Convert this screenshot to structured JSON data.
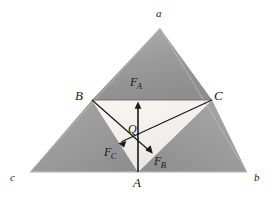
{
  "figure": {
    "background_color": "#ffffff",
    "line_color": "#1a1a1a",
    "corner_fill": "#9c9c9c",
    "center_fill": "#f2f1ee",
    "outer_edge_color": "#b4b4b4"
  },
  "labels": {
    "outer_vertex_top": "a",
    "outer_vertex_left": "c",
    "outer_vertex_right": "b",
    "inner_vertex_left": "B",
    "inner_vertex_right": "C",
    "inner_vertex_bottom": "A",
    "center_point": "Q",
    "force_a_main": "F",
    "force_a_sub": "A",
    "force_b_main": "F",
    "force_b_sub": "B",
    "force_c_main": "F",
    "force_c_sub": "C"
  },
  "geometry": {
    "outer_triangle": {
      "top": [
        160,
        28
      ],
      "left": [
        30,
        172
      ],
      "right": [
        247,
        172
      ]
    },
    "midpoints": {
      "B": [
        92,
        100
      ],
      "C": [
        212,
        100
      ],
      "A": [
        138,
        172
      ]
    },
    "center_point_Q": [
      138,
      134
    ],
    "vectors": [
      {
        "name": "F_A",
        "from": [
          138,
          172
        ],
        "to": [
          138,
          103
        ],
        "direction": "up",
        "label_position": [
          131,
          80
        ]
      },
      {
        "name": "F_C",
        "from": [
          212,
          100
        ],
        "to": [
          119,
          143
        ],
        "direction": "down-left",
        "label_position": [
          108,
          148
        ]
      },
      {
        "name": "F_B",
        "from": [
          92,
          100
        ],
        "to": [
          152,
          153
        ],
        "direction": "down-right",
        "label_position": [
          155,
          157
        ]
      }
    ]
  }
}
